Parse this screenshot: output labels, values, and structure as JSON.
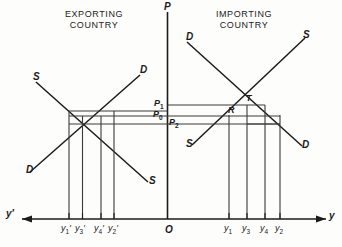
{
  "figure": {
    "type": "economics-diagram"
  },
  "panels": {
    "left": {
      "title_line1": "EXPORTING",
      "title_line2": "COUNTRY",
      "supply_label": "S",
      "supply_label_2": "S",
      "demand_label": "D",
      "demand_label_2": "D",
      "axis_label": "y′",
      "ticks": [
        {
          "label": "y",
          "sub": "1",
          "prime": "′",
          "x": 66
        },
        {
          "label": "y",
          "sub": "3",
          "prime": "′",
          "x": 80
        },
        {
          "label": "y",
          "sub": "4",
          "prime": "′",
          "x": 99
        },
        {
          "label": "y",
          "sub": "2",
          "prime": "′",
          "x": 112
        }
      ]
    },
    "right": {
      "title_line1": "IMPORTING",
      "title_line2": "COUNTRY",
      "supply_label": "S",
      "supply_label_2": "S",
      "demand_label": "D",
      "demand_label_2": "D",
      "axis_label": "y",
      "point_T": "T",
      "point_R": "R",
      "ticks": [
        {
          "label": "y",
          "sub": "1",
          "prime": "",
          "x": 227
        },
        {
          "label": "y",
          "sub": "3",
          "prime": "",
          "x": 245
        },
        {
          "label": "y",
          "sub": "4",
          "prime": "",
          "x": 264
        },
        {
          "label": "y",
          "sub": "2",
          "prime": "",
          "x": 279
        }
      ]
    }
  },
  "axes": {
    "price_axis_label": "P",
    "origin_label": "O"
  },
  "prices": [
    {
      "name": "P",
      "sub": "1",
      "y": 104,
      "side": "left"
    },
    {
      "name": "P",
      "sub": "0",
      "y": 115,
      "side": "left"
    },
    {
      "name": "P",
      "sub": "2",
      "y": 123,
      "side": "right"
    }
  ],
  "colors": {
    "stroke": "#1b1b1b",
    "thin_stroke": "#3a3a3a",
    "background": "#fdfdfb"
  }
}
